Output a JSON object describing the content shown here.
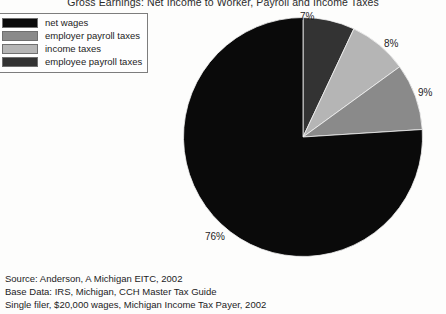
{
  "title": "Gross Earnings: Net Income to Worker, Payroll and Income Taxes",
  "legend": {
    "items": [
      {
        "label": "net wages",
        "color": "#0a0a0a"
      },
      {
        "label": "employer payroll taxes",
        "color": "#8a8a8a"
      },
      {
        "label": "income taxes",
        "color": "#b5b5b5"
      },
      {
        "label": "employee payroll taxes",
        "color": "#333333"
      }
    ]
  },
  "labels": {
    "p0": "7%",
    "p1": "8%",
    "p2": "9%",
    "p3": "76%"
  },
  "source": {
    "line1": "Source: Anderson, A Michigan EITC, 2002",
    "line2": "Base Data: IRS, Michigan, CCH Master Tax Guide",
    "line3": "Single filer, $20,000 wages, Michigan Income Tax Payer, 2002"
  },
  "chart_data": {
    "type": "pie",
    "title": "Gross Earnings: Net Income to Worker, Payroll and Income Taxes",
    "xlabel": "",
    "ylabel": "",
    "legend_position": "top-left",
    "grid": false,
    "start_angle_deg": 90,
    "direction": "clockwise",
    "categories": [
      "employee payroll taxes",
      "income taxes",
      "employer payroll taxes",
      "net wages"
    ],
    "values": [
      7,
      8,
      9,
      76
    ],
    "value_unit": "percent",
    "data_labels": [
      "7%",
      "8%",
      "9%",
      "76%"
    ],
    "colors": [
      "#333333",
      "#b5b5b5",
      "#8a8a8a",
      "#0a0a0a"
    ],
    "annotations": [
      "Source: Anderson, A Michigan EITC, 2002",
      "Base Data: IRS, Michigan, CCH Master Tax Guide",
      "Single filer, $20,000 wages, Michigan Income Tax Payer, 2002"
    ]
  }
}
